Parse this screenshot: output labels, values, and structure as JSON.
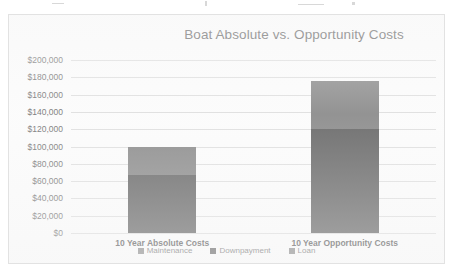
{
  "chart_data": {
    "type": "bar",
    "subtype": "stacked-column",
    "title": "Boat Absolute vs. Opportunity Costs",
    "xlabel": "",
    "ylabel": "",
    "categories": [
      "10 Year Absolute Costs",
      "10 Year Opportunity Costs"
    ],
    "series": [
      {
        "name": "Maintenance",
        "color": "#808080",
        "values": [
          0,
          0
        ]
      },
      {
        "name": "Downpayment",
        "color": "#595959",
        "values": [
          67000,
          120000
        ]
      },
      {
        "name": "Loan",
        "color": "#808080",
        "values": [
          33000,
          56000
        ]
      }
    ],
    "totals": [
      100000,
      176000
    ],
    "ylim": [
      0,
      200000
    ],
    "y_ticks": [
      0,
      20000,
      40000,
      60000,
      80000,
      100000,
      120000,
      140000,
      160000,
      180000,
      200000
    ],
    "y_tick_labels": [
      "$0",
      "$20,000",
      "$40,000",
      "$60,000",
      "$80,000",
      "$100,000",
      "$120,000",
      "$140,000",
      "$160,000",
      "$180,000",
      "$200,000"
    ],
    "grid": true,
    "legend_position": "bottom",
    "legend_entries": [
      "Maintenance",
      "Downpayment",
      "Loan"
    ]
  },
  "colors": {
    "plot_background": "#fbfbfb",
    "frame_border": "#e2e2e2",
    "gridline": "#dcdcdc",
    "title_text": "#4d4d4d",
    "axis_text": "#6b6b6b",
    "series_dark": "#595959",
    "series_light": "#808080"
  }
}
